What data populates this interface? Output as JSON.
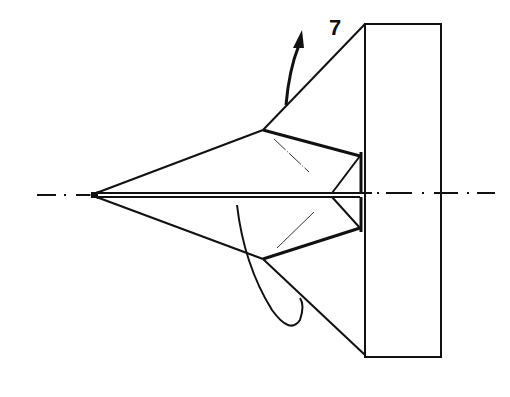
{
  "diagram": {
    "type": "origami-fold-instruction",
    "step_number": "7",
    "colors": {
      "line": "#111111",
      "background": "#ffffff"
    },
    "elements": {
      "centerline": "dash-dot axis line",
      "fold_arrow": "curved arrow pointing up-left",
      "loop_arrow": "curved looping arrow at lower left",
      "paper_shape": "folded paper plane form",
      "rectangle": "vertical rectangle flap at right"
    }
  }
}
